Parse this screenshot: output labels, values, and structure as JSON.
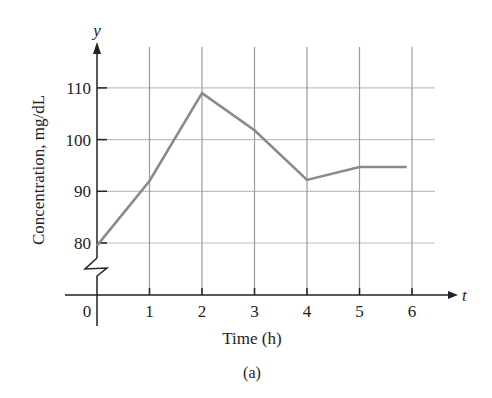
{
  "chart_data": {
    "type": "line",
    "title": "",
    "caption": "(a)",
    "xlabel": "Time (h)",
    "ylabel": "Concentration, mg/dL",
    "x_axis_symbol": "t",
    "y_axis_symbol": "y",
    "x_ticks": [
      0,
      1,
      2,
      3,
      4,
      5,
      6
    ],
    "x_tick_labels": [
      "0",
      "1",
      "2",
      "3",
      "4",
      "5",
      "6"
    ],
    "y_ticks": [
      80,
      90,
      100,
      110
    ],
    "y_tick_labels": [
      "80",
      "90",
      "100",
      "110"
    ],
    "xlim": [
      0,
      6.4
    ],
    "ylim": [
      70,
      116
    ],
    "y_axis_break": true,
    "grid": true,
    "legend": null,
    "series": [
      {
        "name": "Concentration",
        "color": "#8a8a8a",
        "x": [
          0,
          1,
          2,
          3,
          4,
          5,
          5.9
        ],
        "values": [
          79.5,
          92,
          109,
          101.8,
          92.2,
          94.7,
          94.7
        ]
      }
    ]
  },
  "colors": {
    "axis": "#222222",
    "grid": "#9a9a9a",
    "line": "#8a8a8a"
  }
}
